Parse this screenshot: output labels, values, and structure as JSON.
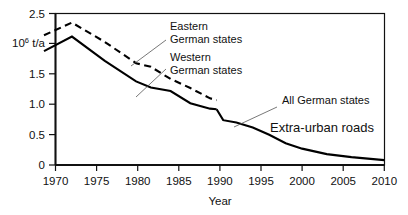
{
  "chart_data": {
    "type": "line",
    "title": "",
    "xlabel": "Year",
    "ylabel": "10⁶ t/a",
    "ylabel_mantissa": "10",
    "ylabel_exponent": "6",
    "ylabel_unit": " t/a",
    "xlim": [
      1968,
      2010
    ],
    "ylim": [
      0,
      2.5
    ],
    "grid": false,
    "legend_position": "inline-annotations",
    "xticks": [
      1970,
      1975,
      1980,
      1985,
      1990,
      1995,
      2000,
      2005,
      2010
    ],
    "xtick_labels": [
      "1970",
      "1975",
      "1980",
      "1985",
      "1990",
      "1995",
      "2000",
      "2005",
      "2010"
    ],
    "yticks": [
      0,
      0.5,
      1.0,
      1.5,
      2.0,
      2.5
    ],
    "ytick_labels": [
      "0",
      "0.5",
      "1.0",
      "1.5",
      "10⁶ t/a",
      "2.5"
    ],
    "ytick_label_at_2_is_unit": true,
    "series": [
      {
        "name": "Eastern German states",
        "style": "dashed",
        "x": [
          1968.6,
          1972.0,
          1976.0,
          1979.8,
          1981.6,
          1984.0,
          1986.4,
          1988.8,
          1989.6
        ],
        "values": [
          2.14,
          2.35,
          2.03,
          1.68,
          1.62,
          1.42,
          1.27,
          1.1,
          1.07
        ]
      },
      {
        "name": "Western German states",
        "style": "solid",
        "x": [
          1968.6,
          1972.0,
          1976.0,
          1979.8,
          1981.6,
          1984.0,
          1986.4,
          1988.8,
          1989.6
        ],
        "values": [
          1.88,
          2.12,
          1.72,
          1.38,
          1.28,
          1.22,
          1.02,
          0.93,
          0.92
        ]
      },
      {
        "name": "All German states",
        "style": "solid",
        "x": [
          1989.6,
          1990.4,
          1992.0,
          1994.0,
          1996.0,
          1998.0,
          2000.0,
          2003.0,
          2006.0,
          2010.0
        ],
        "values": [
          0.92,
          0.74,
          0.7,
          0.62,
          0.5,
          0.36,
          0.27,
          0.18,
          0.13,
          0.08
        ]
      }
    ],
    "annotations": [
      {
        "id": "eastern",
        "text_line1": "Eastern",
        "text_line2": "German states",
        "size": "small"
      },
      {
        "id": "western",
        "text_line1": "Western",
        "text_line2": "German states",
        "size": "small"
      },
      {
        "id": "all",
        "text_line1": "All German states",
        "text_line2": "",
        "size": "small"
      },
      {
        "id": "roads",
        "text_line1": "Extra-urban roads",
        "text_line2": "",
        "size": "large"
      }
    ],
    "colors": {
      "curve": "#000000",
      "axis": "#111111",
      "leader": "#555555",
      "background": "#ffffff"
    }
  }
}
